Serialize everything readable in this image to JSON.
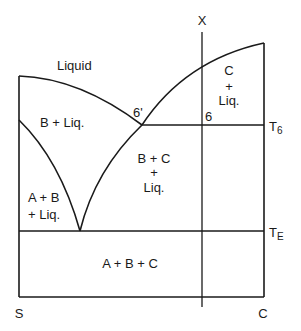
{
  "diagram": {
    "title": "",
    "type": "ternary-section phase diagram",
    "axis": {
      "left_label": "S",
      "right_label": "C",
      "composition_line_label": "X"
    },
    "isotherms": [
      {
        "label": "T",
        "subscript": "6"
      },
      {
        "label": "T",
        "subscript": "E"
      }
    ],
    "points": [
      {
        "label": "6'"
      },
      {
        "label": "6"
      }
    ],
    "regions": {
      "liquid": "Liquid",
      "b_liq": "B + Liq.",
      "c_liq_line1": "C",
      "c_liq_line2": "+",
      "c_liq_line3": "Liq.",
      "bc_liq_line1": "B + C",
      "bc_liq_line2": "+",
      "bc_liq_line3": "Liq.",
      "ab_liq_line1": "A + B",
      "ab_liq_line2": "+ Liq.",
      "abc": "A + B + C"
    },
    "colors": {
      "line": "#1a1a1a",
      "background": "#ffffff"
    }
  }
}
